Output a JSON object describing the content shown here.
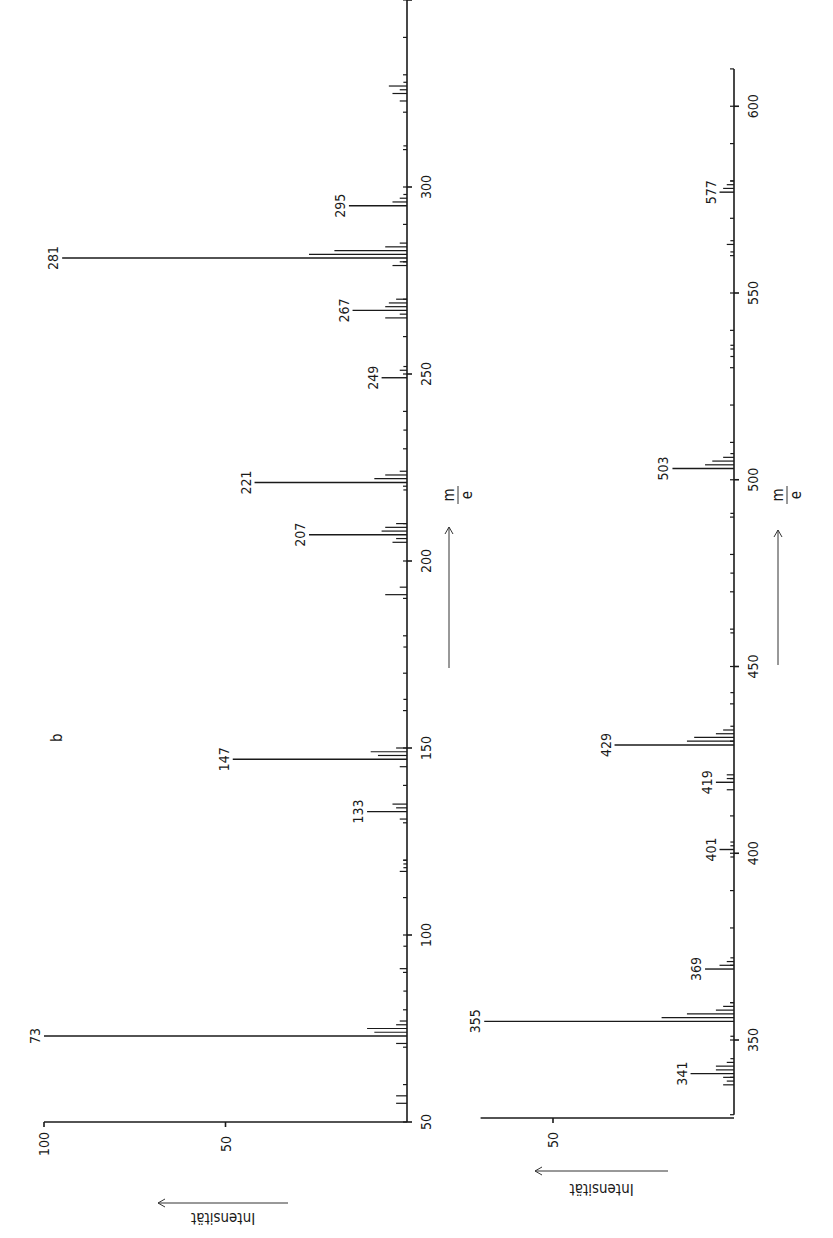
{
  "figure": {
    "panel_label": "b",
    "orientation": "rotated -90deg (m/e increases upward, intensity increases leftward)"
  },
  "chart_data": [
    {
      "type": "bar",
      "title": "",
      "panel": "b (upper range)",
      "xlabel": "m/e",
      "ylabel": "Intensität",
      "xlim": [
        50,
        360
      ],
      "ylim": [
        0,
        100
      ],
      "x_ticks": [
        50,
        100,
        150,
        200,
        250,
        300
      ],
      "y_ticks": [
        50,
        100
      ],
      "grid": false,
      "labeled_peaks": [
        {
          "mz": 73,
          "intensity": 100
        },
        {
          "mz": 133,
          "intensity": 11
        },
        {
          "mz": 147,
          "intensity": 48
        },
        {
          "mz": 207,
          "intensity": 27
        },
        {
          "mz": 221,
          "intensity": 42
        },
        {
          "mz": 249,
          "intensity": 7
        },
        {
          "mz": 267,
          "intensity": 15
        },
        {
          "mz": 281,
          "intensity": 95
        },
        {
          "mz": 295,
          "intensity": 16
        }
      ],
      "minor_peaks": [
        {
          "mz": 55,
          "intensity": 3
        },
        {
          "mz": 57,
          "intensity": 3
        },
        {
          "mz": 71,
          "intensity": 3
        },
        {
          "mz": 74,
          "intensity": 9
        },
        {
          "mz": 75,
          "intensity": 11
        },
        {
          "mz": 76,
          "intensity": 3
        },
        {
          "mz": 77,
          "intensity": 2
        },
        {
          "mz": 85,
          "intensity": 1
        },
        {
          "mz": 91,
          "intensity": 2
        },
        {
          "mz": 97,
          "intensity": 1
        },
        {
          "mz": 117,
          "intensity": 2
        },
        {
          "mz": 118,
          "intensity": 1
        },
        {
          "mz": 119,
          "intensity": 1
        },
        {
          "mz": 120,
          "intensity": 1
        },
        {
          "mz": 131,
          "intensity": 2
        },
        {
          "mz": 134,
          "intensity": 3
        },
        {
          "mz": 135,
          "intensity": 4
        },
        {
          "mz": 148,
          "intensity": 8
        },
        {
          "mz": 149,
          "intensity": 10
        },
        {
          "mz": 150,
          "intensity": 3
        },
        {
          "mz": 145,
          "intensity": 2
        },
        {
          "mz": 163,
          "intensity": 1
        },
        {
          "mz": 177,
          "intensity": 1
        },
        {
          "mz": 191,
          "intensity": 6
        },
        {
          "mz": 193,
          "intensity": 2
        },
        {
          "mz": 205,
          "intensity": 4
        },
        {
          "mz": 206,
          "intensity": 3
        },
        {
          "mz": 208,
          "intensity": 7
        },
        {
          "mz": 209,
          "intensity": 6
        },
        {
          "mz": 210,
          "intensity": 3
        },
        {
          "mz": 219,
          "intensity": 1
        },
        {
          "mz": 222,
          "intensity": 9
        },
        {
          "mz": 223,
          "intensity": 6
        },
        {
          "mz": 224,
          "intensity": 2
        },
        {
          "mz": 235,
          "intensity": 1
        },
        {
          "mz": 251,
          "intensity": 2
        },
        {
          "mz": 252,
          "intensity": 1
        },
        {
          "mz": 265,
          "intensity": 6
        },
        {
          "mz": 266,
          "intensity": 2
        },
        {
          "mz": 268,
          "intensity": 6
        },
        {
          "mz": 269,
          "intensity": 5
        },
        {
          "mz": 270,
          "intensity": 3
        },
        {
          "mz": 279,
          "intensity": 4
        },
        {
          "mz": 280,
          "intensity": 2
        },
        {
          "mz": 282,
          "intensity": 27
        },
        {
          "mz": 283,
          "intensity": 20
        },
        {
          "mz": 284,
          "intensity": 6
        },
        {
          "mz": 285,
          "intensity": 2
        },
        {
          "mz": 296,
          "intensity": 4
        },
        {
          "mz": 297,
          "intensity": 2
        },
        {
          "mz": 298,
          "intensity": 1
        },
        {
          "mz": 311,
          "intensity": 1
        },
        {
          "mz": 323,
          "intensity": 2
        },
        {
          "mz": 325,
          "intensity": 4
        },
        {
          "mz": 326,
          "intensity": 2
        },
        {
          "mz": 327,
          "intensity": 5
        },
        {
          "mz": 328,
          "intensity": 1
        }
      ]
    },
    {
      "type": "bar",
      "title": "",
      "panel": "b (lower range)",
      "xlabel": "m/e",
      "ylabel": "Intensität",
      "xlim": [
        330,
        610
      ],
      "ylim": [
        0,
        70
      ],
      "x_ticks": [
        350,
        400,
        450,
        500,
        550,
        600
      ],
      "y_ticks": [
        50
      ],
      "grid": false,
      "labeled_peaks": [
        {
          "mz": 341,
          "intensity": 12
        },
        {
          "mz": 355,
          "intensity": 69
        },
        {
          "mz": 369,
          "intensity": 8
        },
        {
          "mz": 401,
          "intensity": 4
        },
        {
          "mz": 419,
          "intensity": 5
        },
        {
          "mz": 429,
          "intensity": 33
        },
        {
          "mz": 503,
          "intensity": 17
        },
        {
          "mz": 577,
          "intensity": 4
        }
      ],
      "minor_peaks": [
        {
          "mz": 338,
          "intensity": 3
        },
        {
          "mz": 339,
          "intensity": 2
        },
        {
          "mz": 340,
          "intensity": 3
        },
        {
          "mz": 342,
          "intensity": 5
        },
        {
          "mz": 343,
          "intensity": 5
        },
        {
          "mz": 344,
          "intensity": 2
        },
        {
          "mz": 345,
          "intensity": 1
        },
        {
          "mz": 351,
          "intensity": 1
        },
        {
          "mz": 356,
          "intensity": 20
        },
        {
          "mz": 357,
          "intensity": 13
        },
        {
          "mz": 358,
          "intensity": 5
        },
        {
          "mz": 359,
          "intensity": 3
        },
        {
          "mz": 360,
          "intensity": 1
        },
        {
          "mz": 370,
          "intensity": 4
        },
        {
          "mz": 371,
          "intensity": 2
        },
        {
          "mz": 372,
          "intensity": 1
        },
        {
          "mz": 399,
          "intensity": 1
        },
        {
          "mz": 402,
          "intensity": 1
        },
        {
          "mz": 403,
          "intensity": 1
        },
        {
          "mz": 417,
          "intensity": 2
        },
        {
          "mz": 420,
          "intensity": 2
        },
        {
          "mz": 421,
          "intensity": 2
        },
        {
          "mz": 430,
          "intensity": 13
        },
        {
          "mz": 431,
          "intensity": 11
        },
        {
          "mz": 432,
          "intensity": 5
        },
        {
          "mz": 433,
          "intensity": 3
        },
        {
          "mz": 434,
          "intensity": 1
        },
        {
          "mz": 443,
          "intensity": 1
        },
        {
          "mz": 459,
          "intensity": 1
        },
        {
          "mz": 475,
          "intensity": 1
        },
        {
          "mz": 491,
          "intensity": 1
        },
        {
          "mz": 504,
          "intensity": 8
        },
        {
          "mz": 505,
          "intensity": 6
        },
        {
          "mz": 506,
          "intensity": 3
        },
        {
          "mz": 507,
          "intensity": 1
        },
        {
          "mz": 533,
          "intensity": 1
        },
        {
          "mz": 535,
          "intensity": 1
        },
        {
          "mz": 536,
          "intensity": 1
        },
        {
          "mz": 561,
          "intensity": 1
        },
        {
          "mz": 563,
          "intensity": 2
        },
        {
          "mz": 564,
          "intensity": 1
        },
        {
          "mz": 578,
          "intensity": 3
        },
        {
          "mz": 579,
          "intensity": 2
        },
        {
          "mz": 580,
          "intensity": 1
        }
      ]
    }
  ],
  "labels": {
    "intensity_axis": "Intensität",
    "mz_numerator": "m",
    "mz_denominator": "e"
  }
}
